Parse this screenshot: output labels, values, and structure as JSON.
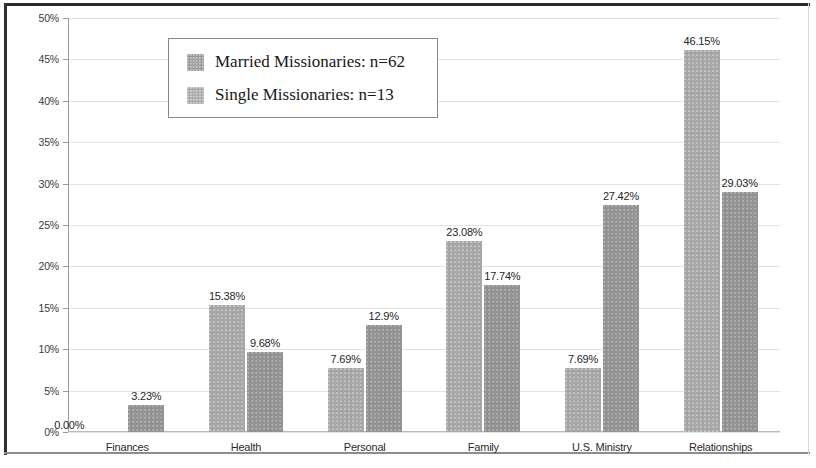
{
  "chart_data": {
    "type": "bar",
    "title": "",
    "xlabel": "",
    "ylabel": "",
    "ylim": [
      0,
      50
    ],
    "ytick_step": 5,
    "grid": true,
    "legend_position": "top-left-inside",
    "categories": [
      "Finances",
      "Health",
      "Personal",
      "Family",
      "U.S. Ministry",
      "Relationships"
    ],
    "series": [
      {
        "name": "Married Missionaries: n=62",
        "n": 62,
        "color": "#a8a8a8",
        "values": [
          0.0,
          15.38,
          7.69,
          23.08,
          7.69,
          46.15
        ],
        "labels": [
          "0.00%",
          "15.38%",
          "7.69%",
          "23.08%",
          "7.69%",
          "46.15%"
        ]
      },
      {
        "name": "Single Missionaries: n=13",
        "n": 13,
        "color": "#949494",
        "values": [
          3.23,
          9.68,
          12.9,
          17.74,
          27.42,
          29.03
        ],
        "labels": [
          "3.23%",
          "9.68%",
          "12.9%",
          "17.74%",
          "27.42%",
          "29.03%"
        ]
      }
    ],
    "yticks": [
      {
        "value": 50,
        "label": "50%"
      },
      {
        "value": 45,
        "label": "45%"
      },
      {
        "value": 40,
        "label": "40%"
      },
      {
        "value": 35,
        "label": "35%"
      },
      {
        "value": 30,
        "label": "30%"
      },
      {
        "value": 25,
        "label": "25%"
      },
      {
        "value": 20,
        "label": "20%"
      },
      {
        "value": 15,
        "label": "15%"
      },
      {
        "value": 10,
        "label": "10%"
      },
      {
        "value": 5,
        "label": "5%"
      },
      {
        "value": 0,
        "label": "0%"
      }
    ]
  },
  "legend": {
    "entries": [
      {
        "label": "Married Missionaries: n=62"
      },
      {
        "label": "Single Missionaries: n=13"
      }
    ]
  }
}
